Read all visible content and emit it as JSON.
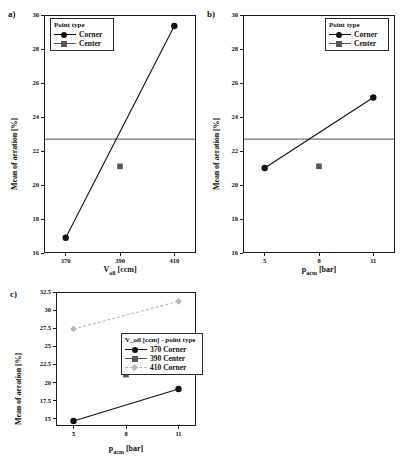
{
  "figure": {
    "panels": [
      {
        "letter": "a)",
        "ylabel": "Mean of aeration [%]",
        "xlabel_main": "V",
        "xlabel_sub": "oil",
        "xlabel_unit": " [ccm]",
        "xlabel_full": "V_oil [ccm]",
        "yticks": [
          "30",
          "28",
          "26",
          "24",
          "22",
          "20",
          "18",
          "16"
        ],
        "xticks": [
          "370",
          "390",
          "410"
        ],
        "legend_title": "Point type",
        "legend": [
          {
            "label": "Corner",
            "marker": "circle",
            "color": "#111111",
            "line": "solid"
          },
          {
            "label": "Center",
            "marker": "square",
            "color": "#565656",
            "line": "solid"
          }
        ]
      },
      {
        "letter": "b)",
        "ylabel": "Mean of aeration [%]",
        "xlabel_main": "p",
        "xlabel_sub": "acm",
        "xlabel_unit": " [bar]",
        "xlabel_full": "p_acm [bar]",
        "yticks": [
          "30",
          "28",
          "26",
          "24",
          "22",
          "20",
          "18",
          "16"
        ],
        "xticks": [
          "5",
          "8",
          "11"
        ],
        "legend_title": "Point type",
        "legend": [
          {
            "label": "Corner",
            "marker": "circle",
            "color": "#111111",
            "line": "solid"
          },
          {
            "label": "Center",
            "marker": "square",
            "color": "#565656",
            "line": "solid"
          }
        ]
      },
      {
        "letter": "c)",
        "ylabel": "Mean of aeration [%]",
        "xlabel_main": "p",
        "xlabel_sub": "acm",
        "xlabel_unit": " [bar]",
        "xlabel_full": "p_acm [bar]",
        "yticks": [
          "32.5",
          "30",
          "27.5",
          "25",
          "22.5",
          "20",
          "17.5",
          "15"
        ],
        "xticks": [
          "5",
          "8",
          "11"
        ],
        "legend_title": "V_oil [ccm] - point type",
        "legend": [
          {
            "label": "370 Corner",
            "marker": "circle",
            "color": "#111111",
            "line": "solid"
          },
          {
            "label": "390 Center",
            "marker": "square",
            "color": "#565656",
            "line": "solid"
          },
          {
            "label": "410 Corner",
            "marker": "diamond",
            "color": "#b9b9b9",
            "line": "dashed"
          }
        ]
      }
    ]
  },
  "chart_data": [
    {
      "type": "line",
      "panel": "a)",
      "title": "",
      "xlabel": "V_oil [ccm]",
      "ylabel": "Mean of aeration [%]",
      "x": [
        370,
        390,
        410
      ],
      "xlim": [
        362,
        418
      ],
      "ylim": [
        16,
        30
      ],
      "yticks": [
        16,
        18,
        20,
        22,
        24,
        26,
        28,
        30
      ],
      "xticks": [
        370,
        390,
        410
      ],
      "grid": false,
      "legend_position": "top-left",
      "reference_line": 22.7,
      "series": [
        {
          "name": "Corner",
          "marker": "circle",
          "color": "#111111",
          "line": "solid",
          "points": [
            {
              "x": 370,
              "y": 16.9
            },
            {
              "x": 410,
              "y": 29.35
            }
          ]
        },
        {
          "name": "Center",
          "marker": "square",
          "color": "#565656",
          "line": "none",
          "points": [
            {
              "x": 390,
              "y": 21.1
            }
          ]
        }
      ]
    },
    {
      "type": "line",
      "panel": "b)",
      "title": "",
      "xlabel": "p_acm [bar]",
      "ylabel": "Mean of aeration [%]",
      "x": [
        5,
        8,
        11
      ],
      "xlim": [
        3.8,
        12.2
      ],
      "ylim": [
        16,
        30
      ],
      "yticks": [
        16,
        18,
        20,
        22,
        24,
        26,
        28,
        30
      ],
      "xticks": [
        5,
        8,
        11
      ],
      "grid": false,
      "legend_position": "top-right",
      "reference_line": 22.7,
      "series": [
        {
          "name": "Corner",
          "marker": "circle",
          "color": "#111111",
          "line": "solid",
          "points": [
            {
              "x": 5,
              "y": 21.0
            },
            {
              "x": 11,
              "y": 25.15
            }
          ]
        },
        {
          "name": "Center",
          "marker": "square",
          "color": "#565656",
          "line": "none",
          "points": [
            {
              "x": 8,
              "y": 21.1
            }
          ]
        }
      ]
    },
    {
      "type": "line",
      "panel": "c)",
      "title": "",
      "xlabel": "p_acm [bar]",
      "ylabel": "Mean of aeration [%]",
      "x": [
        5,
        8,
        11
      ],
      "xlim": [
        4.0,
        12.0
      ],
      "ylim": [
        14.0,
        32.5
      ],
      "yticks": [
        15,
        17.5,
        20,
        22.5,
        25,
        27.5,
        30,
        32.5
      ],
      "xticks": [
        5,
        8,
        11
      ],
      "grid": false,
      "legend_position": "center",
      "series": [
        {
          "name": "370 Corner",
          "marker": "circle",
          "color": "#111111",
          "line": "solid",
          "points": [
            {
              "x": 5,
              "y": 14.7
            },
            {
              "x": 11,
              "y": 19.1
            }
          ]
        },
        {
          "name": "390 Center",
          "marker": "square",
          "color": "#565656",
          "line": "none",
          "points": [
            {
              "x": 8,
              "y": 21.1
            }
          ]
        },
        {
          "name": "410 Corner",
          "marker": "diamond",
          "color": "#b9b9b9",
          "line": "dashed",
          "points": [
            {
              "x": 5,
              "y": 27.4
            },
            {
              "x": 11,
              "y": 31.2
            }
          ]
        }
      ]
    }
  ]
}
